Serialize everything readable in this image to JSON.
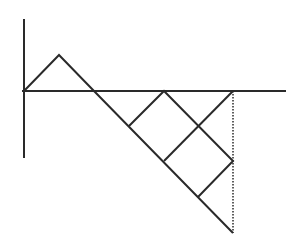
{
  "diagram": {
    "stroke_color": "#2a2a2a",
    "background": "#ffffff",
    "axes": {
      "vertical": {
        "x1": 24,
        "y1": 19,
        "x2": 24,
        "y2": 158
      },
      "horizontal": {
        "x1": 22,
        "y1": 91,
        "x2": 286,
        "y2": 91
      }
    },
    "paths": [
      {
        "name": "main-zigzag",
        "points": "24,91 59,55 94,91 233,233"
      },
      {
        "name": "inner-zigzag",
        "points": "129,126 164,91 233,161 198,197"
      },
      {
        "name": "cross-line",
        "points": "164,161 233,91"
      }
    ],
    "dotted_line": {
      "x1": 233,
      "y1": 91,
      "x2": 233,
      "y2": 233
    }
  }
}
